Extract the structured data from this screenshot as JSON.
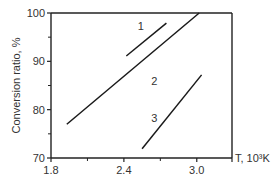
{
  "chart_data": {
    "type": "line",
    "title": "",
    "xlabel": "T, 10³K",
    "ylabel": "Conversion ratio, %",
    "xlim": [
      1.8,
      3.29
    ],
    "ylim": [
      70,
      100
    ],
    "x_ticks": [
      "1.8",
      "2.4",
      "3.0"
    ],
    "x_minor_ticks": [
      2.1,
      2.7
    ],
    "y_ticks": [
      "70",
      "80",
      "90",
      "100"
    ],
    "y_minor_ticks": [
      75,
      85,
      95
    ],
    "grid": false,
    "legend": "inline labels",
    "series": [
      {
        "name": "1",
        "x": [
          2.42,
          2.75
        ],
        "y": [
          91.1,
          97.9
        ]
      },
      {
        "name": "2",
        "x": [
          1.93,
          3.02
        ],
        "y": [
          77.0,
          100.0
        ]
      },
      {
        "name": "3",
        "x": [
          2.55,
          3.04
        ],
        "y": [
          71.9,
          87.2
        ]
      }
    ],
    "series_labels": [
      {
        "text": "1",
        "x": 2.54,
        "y": 96.5
      },
      {
        "text": "2",
        "x": 2.65,
        "y": 85.2
      },
      {
        "text": "3",
        "x": 2.65,
        "y": 77.5
      }
    ]
  }
}
